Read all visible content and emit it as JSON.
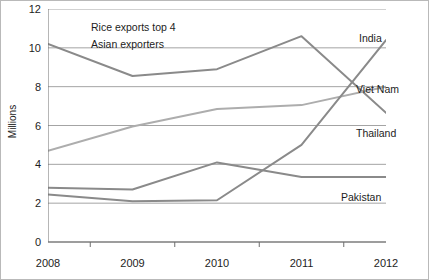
{
  "chart_data": {
    "type": "line",
    "title": "",
    "annotations": [
      "Rice exports top 4",
      "Asian exporters"
    ],
    "xlabel": "",
    "ylabel": "Millions",
    "categories": [
      "2008",
      "2009",
      "2010",
      "2011",
      "2012"
    ],
    "x": [
      2008,
      2009,
      2010,
      2011,
      2012
    ],
    "ylim": [
      0,
      12
    ],
    "yticks": [
      "0",
      "2",
      "4",
      "6",
      "8",
      "10",
      "12"
    ],
    "ytick_values": [
      0,
      2,
      4,
      6,
      8,
      10,
      12
    ],
    "grid": "horizontal",
    "legend": "inline-right-labels",
    "series": [
      {
        "name": "Thailand",
        "values": [
          10.2,
          8.55,
          8.9,
          10.6,
          6.65
        ],
        "color": "#8a8a8a"
      },
      {
        "name": "Viet Nam",
        "values": [
          4.7,
          5.95,
          6.85,
          7.05,
          8.0
        ],
        "color": "#adadad"
      },
      {
        "name": "India",
        "values": [
          2.45,
          2.1,
          2.15,
          5.0,
          10.4
        ],
        "color": "#8a8a8a"
      },
      {
        "name": "Pakistan",
        "values": [
          2.8,
          2.7,
          4.1,
          3.35,
          3.35
        ],
        "color": "#8a8a8a"
      }
    ]
  },
  "labels": {
    "india": "India",
    "viet_nam": "Viet Nam",
    "thailand": "Thailand",
    "pakistan": "Pakistan"
  },
  "axis": {
    "y_title": "Millions"
  },
  "colors": {
    "grid": "#9a9a9a",
    "axis": "#6e6e6e",
    "text": "#1d1d1d",
    "border": "#b9b9b9"
  }
}
